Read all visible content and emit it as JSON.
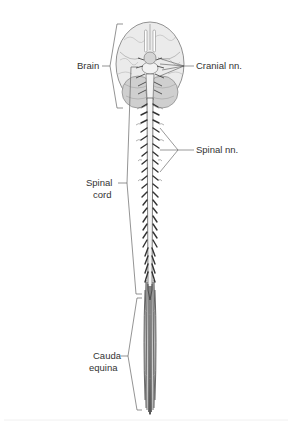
{
  "figure": {
    "labels": {
      "brain": "Brain",
      "cranial_nerves": "Cranial nn.",
      "spinal_nerves": "Spinal nn.",
      "spinal_cord_line1": "Spinal",
      "spinal_cord_line2": "cord",
      "cauda_equina_line1": "Cauda",
      "cauda_equina_line2": "equina"
    },
    "colors": {
      "line": "#555555",
      "brain_fill": "#e6e6e6",
      "cerebellum_fill": "#c8c8c8",
      "cord_fill": "#f4f4f4",
      "nerve": "#3a3a3a"
    }
  }
}
